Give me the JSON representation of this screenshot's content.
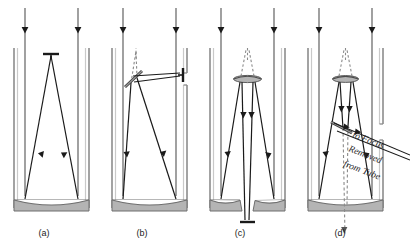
{
  "figure": {
    "panels": [
      {
        "id": "a",
        "caption": "(a)",
        "name": "prime-focus",
        "caption_x": 44,
        "caption_y": 228
      },
      {
        "id": "b",
        "caption": "(b)",
        "name": "newtonian-focus",
        "caption_x": 142,
        "caption_y": 228
      },
      {
        "id": "c",
        "caption": "(c)",
        "name": "cassegrain-focus",
        "caption_x": 240,
        "caption_y": 228
      },
      {
        "id": "d",
        "caption": "(d)",
        "name": "coude-focus",
        "caption_x": 340,
        "caption_y": 228
      }
    ],
    "annotations": {
      "coude_line1": "to Focus",
      "coude_line2": "Removed",
      "coude_line3": "from Tube"
    },
    "colors": {
      "ray": "#1a1a1a",
      "tube_wall": "#8c8c8c",
      "mirror_fill": "#b4b4b4",
      "mirror_stroke": "#6e6e6e",
      "virtual_ray": "#7a7a7a",
      "caption_text": "#1a1a1a",
      "background": "#ffffff"
    }
  }
}
